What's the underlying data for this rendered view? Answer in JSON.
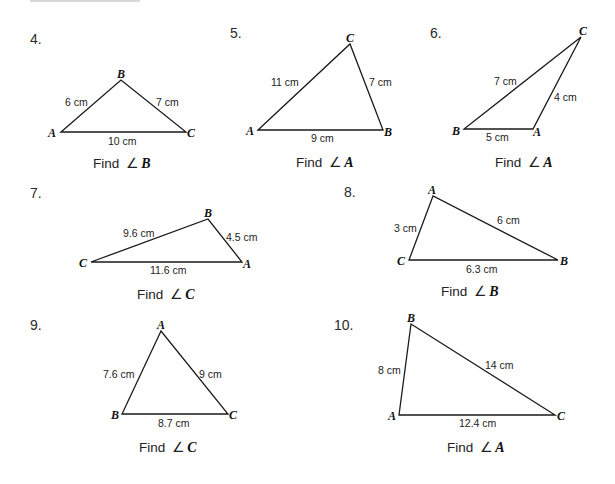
{
  "problems": [
    {
      "number": "4.",
      "vertices": {
        "A": "A",
        "B": "B",
        "C": "C"
      },
      "sides": {
        "AB": "6 cm",
        "BC": "7 cm",
        "AC": "10 cm"
      },
      "find_label": "Find",
      "angle_symbol": "∠",
      "find_angle": "B"
    },
    {
      "number": "5.",
      "vertices": {
        "A": "A",
        "B": "B",
        "C": "C"
      },
      "sides": {
        "AC": "11 cm",
        "BC": "7 cm",
        "AB": "9 cm"
      },
      "find_label": "Find",
      "angle_symbol": "∠",
      "find_angle": "A"
    },
    {
      "number": "6.",
      "vertices": {
        "A": "A",
        "B": "B",
        "C": "C"
      },
      "sides": {
        "BC": "7 cm",
        "AC": "4 cm",
        "AB": "5 cm"
      },
      "find_label": "Find",
      "angle_symbol": "∠",
      "find_angle": "A"
    },
    {
      "number": "7.",
      "vertices": {
        "A": "A",
        "B": "B",
        "C": "C"
      },
      "sides": {
        "BC": "9.6 cm",
        "AB": "4.5 cm",
        "AC": "11.6 cm"
      },
      "find_label": "Find",
      "angle_symbol": "∠",
      "find_angle": "C"
    },
    {
      "number": "8.",
      "vertices": {
        "A": "A",
        "B": "B",
        "C": "C"
      },
      "sides": {
        "AC": "3 cm",
        "AB": "6 cm",
        "BC": "6.3 cm"
      },
      "find_label": "Find",
      "angle_symbol": "∠",
      "find_angle": "B"
    },
    {
      "number": "9.",
      "vertices": {
        "A": "A",
        "B": "B",
        "C": "C"
      },
      "sides": {
        "AB": "7.6 cm",
        "AC": "9 cm",
        "BC": "8.7 cm"
      },
      "find_label": "Find",
      "angle_symbol": "∠",
      "find_angle": "C"
    },
    {
      "number": "10.",
      "vertices": {
        "A": "A",
        "B": "B",
        "C": "C"
      },
      "sides": {
        "AB": "8 cm",
        "BC": "14 cm",
        "AC": "12.4 cm"
      },
      "find_label": "Find",
      "angle_symbol": "∠",
      "find_angle": "A"
    }
  ]
}
